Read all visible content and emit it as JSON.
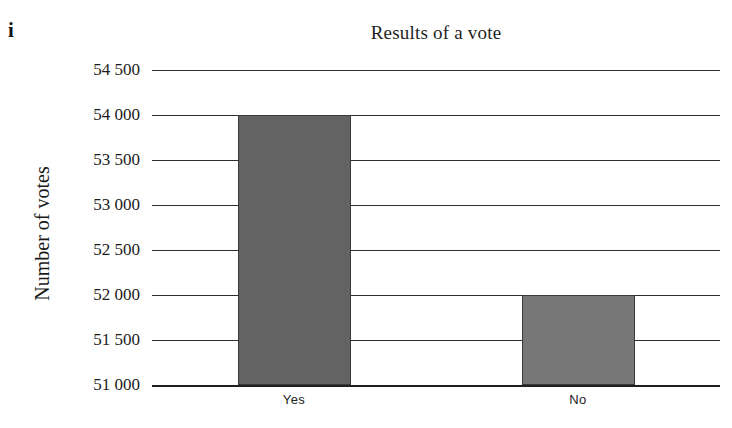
{
  "item_marker": "i",
  "chart_data": {
    "type": "bar",
    "title": "Results of a vote",
    "xlabel": "",
    "ylabel": "Number of votes",
    "categories": [
      "Yes",
      "No"
    ],
    "values": [
      54000,
      52000
    ],
    "ylim": [
      51000,
      54500
    ],
    "ytick_values": [
      51000,
      51500,
      52000,
      52500,
      53000,
      53500,
      54000,
      54500
    ],
    "ytick_labels": [
      "51 000",
      "51 500",
      "52 000",
      "52 500",
      "53 000",
      "53 500",
      "54 000",
      "54 500"
    ],
    "grid": true,
    "legend": false,
    "bar_colors": [
      "#636363",
      "#777777"
    ],
    "bar_edge_color": "#3a3a3a",
    "gridline_color": "#2e2e2e",
    "axis_color": "#202020"
  }
}
